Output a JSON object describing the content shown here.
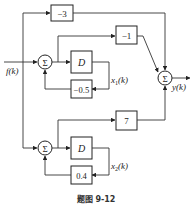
{
  "diagram": {
    "input_label": "f(k)",
    "output_label": "y(k)",
    "caption": "题图 9-12",
    "blocks": {
      "gain_top": "−3",
      "gain_upper_branch": "−1",
      "delay_1": "D",
      "feedback_1": "−0.5",
      "gain_lower_branch": "7",
      "delay_2": "D",
      "feedback_2": "0.4"
    },
    "state_labels": {
      "x1": "x",
      "x1_sub": "1",
      "x1_arg": "(k)",
      "x2": "x",
      "x2_sub": "2",
      "x2_arg": "(k)"
    },
    "summers": {
      "sum_1": "Σ",
      "sum_2": "Σ",
      "sum_out": "Σ"
    }
  }
}
